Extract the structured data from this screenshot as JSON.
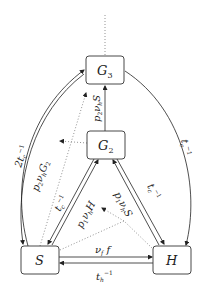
{
  "diagram": {
    "type": "state-transition",
    "nodes": [
      {
        "id": "G3",
        "label": "G",
        "sub": "3"
      },
      {
        "id": "G2",
        "label": "G",
        "sub": "2"
      },
      {
        "id": "S",
        "label": "S"
      },
      {
        "id": "H",
        "label": "H"
      }
    ],
    "edges": [
      {
        "from": "G2",
        "to": "G3",
        "label": "p2 νh S",
        "style": "solid"
      },
      {
        "from": "S",
        "to": "G3",
        "label": "2tc⁻¹",
        "style": "double"
      },
      {
        "from": "G3",
        "to": "H",
        "label": "tc⁻¹",
        "style": "solid"
      },
      {
        "from": "S",
        "to": "G2",
        "label": "p1 νh H",
        "style": "double"
      },
      {
        "from": "G2",
        "to": "H",
        "label": "p1 νh S",
        "style": "double"
      },
      {
        "from": "S",
        "to": "H",
        "label": "νf f",
        "style": "solid"
      },
      {
        "from": "H",
        "to": "S",
        "label": "th⁻¹",
        "style": "solid"
      },
      {
        "from": "G2",
        "to": "G3-S-edge",
        "label": "p2 νh G2",
        "style": "dotted"
      },
      {
        "from": "G3",
        "to": "above",
        "style": "dotted"
      }
    ]
  }
}
